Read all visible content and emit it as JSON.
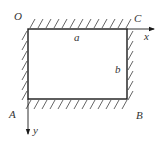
{
  "figure": {
    "type": "rectangular-plate-diagram",
    "colors": {
      "stroke": "#1a1a1a",
      "hatch": "#555555",
      "text": "#333333",
      "background": "#ffffff"
    },
    "rectangle": {
      "x": 28,
      "y": 29,
      "width": 99,
      "height": 70
    },
    "corners": {
      "top_left": "O",
      "top_right": "C",
      "bottom_left": "A",
      "bottom_right": "B"
    },
    "dimensions": {
      "width_label": "a",
      "height_label": "b"
    },
    "axes": {
      "x_label": "x",
      "y_label": "y"
    },
    "supports": [
      "top",
      "left",
      "right",
      "bottom"
    ]
  }
}
